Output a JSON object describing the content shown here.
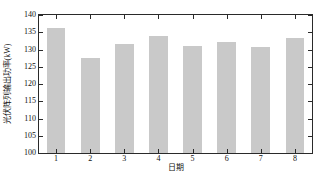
{
  "chart_data": {
    "type": "bar",
    "title": "",
    "subtitle": "",
    "xlabel": "日期",
    "ylabel": "光伏阵列输出功率(kW)",
    "categories": [
      "1",
      "2",
      "3",
      "4",
      "5",
      "6",
      "7",
      "8"
    ],
    "values": [
      136.1,
      127.5,
      131.5,
      134.0,
      131.0,
      132.2,
      130.7,
      133.3
    ],
    "series": [
      {
        "name": "光伏阵列输出功率",
        "values": [
          136.1,
          127.5,
          131.5,
          134.0,
          131.0,
          132.2,
          130.7,
          133.3
        ]
      }
    ],
    "ylim": [
      100,
      140
    ],
    "xlim": [
      0.5,
      8.5
    ],
    "yticks": [
      100,
      105,
      110,
      115,
      120,
      125,
      130,
      135,
      140
    ],
    "ytick_labels": [
      "100",
      "105",
      "110",
      "115",
      "120",
      "125",
      "130",
      "135",
      "140"
    ],
    "xticks": [
      1,
      2,
      3,
      4,
      5,
      6,
      7,
      8
    ],
    "xtick_labels": [
      "1",
      "2",
      "3",
      "4",
      "5",
      "6",
      "7",
      "8"
    ],
    "grid": false,
    "legend": null,
    "legend_position": "none",
    "bar_color": "#c9c9c9",
    "axis_color": "#2a2a2a",
    "background_color": "#ffffff",
    "bar_width_fraction": 0.55
  }
}
